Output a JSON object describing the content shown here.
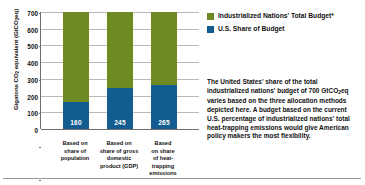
{
  "chart_data": {
    "type": "bar",
    "stacked": true,
    "title": "",
    "subtitle": "",
    "xlabel": "",
    "ylabel": "Gigatons CO2 equivalent (GtCO2eq)",
    "ylabel_parts": {
      "lead": "Gigatons CO",
      "sub1": "2",
      "mid": " equivalent (GtCO",
      "sub2": "2",
      "tail": "eq)"
    },
    "ylim": [
      0,
      700
    ],
    "ytick_step": 100,
    "yticks": [
      0,
      100,
      200,
      300,
      400,
      500,
      600,
      700
    ],
    "ytick_labels": [
      "0",
      "100",
      "200",
      "300",
      "400",
      "500",
      "600",
      "700"
    ],
    "grid": true,
    "legend_position": "right",
    "categories": [
      "Based on share of population",
      "Based on share of gross domestic product (GDP)",
      "Based on share of heat-trapping emissions"
    ],
    "category_lines": [
      [
        "Based on",
        "share of",
        "population"
      ],
      [
        "Based on",
        "share of gross",
        "domestic",
        "product (GDP)"
      ],
      [
        "Based",
        "on share",
        "of heat-",
        "trapping",
        "emissions"
      ]
    ],
    "series": [
      {
        "name": "U.S. Share of Budget",
        "color": "#115c91",
        "values": [
          160,
          245,
          265
        ],
        "value_labels": [
          "160",
          "245",
          "265"
        ]
      },
      {
        "name": "Industrialized Nations' Total Budget*",
        "color": "#6d8b22",
        "values": [
          700,
          700,
          700
        ],
        "value_labels": [
          "",
          "",
          ""
        ]
      }
    ]
  },
  "legend": {
    "items": [
      {
        "label": "Industrialized Nations' Total Budget*",
        "color": "#6d8b22",
        "swatch_name": "legend-swatch-total-budget"
      },
      {
        "label": "U.S. Share of Budget",
        "color": "#115c91",
        "swatch_name": "legend-swatch-us-share"
      }
    ]
  },
  "caption": {
    "line1": "The United States' share of the total",
    "line2_lead": "industrialized nations' budget of 700",
    "line3_lead": "GtCO",
    "line3_sub": "2",
    "line3_tail": "eq varies based on the three",
    "line4": "allocation methods depicted here.",
    "line5": "A budget based on the current U.S.",
    "line6": "percentage of industrialized nations'",
    "line7": "total heat-trapping emissions would",
    "line8": "give American policy makers the",
    "line9": "most flexibility."
  },
  "colors": {
    "total_budget_green": "#6d8b22",
    "us_share_blue": "#115c91",
    "gridline": "#b9b9b9",
    "axis": "#6f6f6f",
    "text": "#111111",
    "background": "#ffffff"
  }
}
